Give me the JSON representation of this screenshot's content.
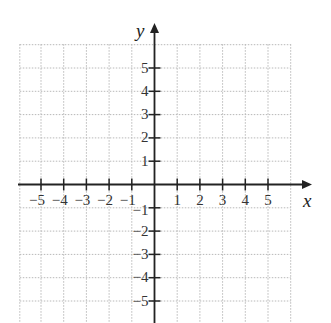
{
  "chart_data": {
    "type": "scatter",
    "title": "",
    "xlabel": "x",
    "ylabel": "y",
    "xlim": [
      -6,
      6
    ],
    "ylim": [
      -6,
      6
    ],
    "grid": true,
    "grid_style": "dotted",
    "x_ticks": [
      -5,
      -4,
      -3,
      -2,
      -1,
      1,
      2,
      3,
      4,
      5
    ],
    "y_ticks": [
      5,
      4,
      3,
      2,
      1,
      -1,
      -2,
      -3,
      -4,
      -5
    ],
    "x_tick_labels": [
      "−5",
      "−4",
      "−3",
      "−2",
      "−1",
      "1",
      "2",
      "3",
      "4",
      "5"
    ],
    "y_tick_labels": [
      "5",
      "4",
      "3",
      "2",
      "1",
      "−1",
      "−2",
      "−3",
      "−4",
      "−5"
    ],
    "series": [],
    "legend": null
  },
  "colors": {
    "axis": "#222222",
    "grid": "#b8b8b8",
    "text": "#333333"
  },
  "axes": {
    "x_name": "x",
    "y_name": "y"
  }
}
